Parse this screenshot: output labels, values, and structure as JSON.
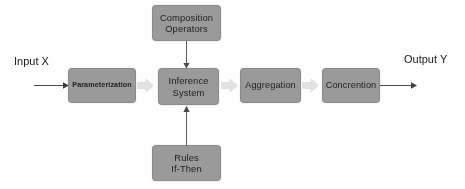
{
  "diagram": {
    "type": "flowchart",
    "canvas": {
      "width": 465,
      "height": 189,
      "background": "#fefefe"
    },
    "palette": {
      "box_fill": "#9a9a9a",
      "box_border": "#8a8a8a",
      "box_text": "#1d1d1d",
      "label_text": "#202020",
      "thin_arrow": "#4a4a4a",
      "block_arrow_fill": "#e2e2e2",
      "block_arrow_stroke": "#d2d2d2",
      "connector_line": "#5a5a5a"
    },
    "labels": {
      "input": "Input X",
      "output": "Output Y"
    },
    "nodes": [
      {
        "id": "parameterization",
        "label": "Parameterization",
        "lines": [
          "Parameterization"
        ],
        "stage": 1,
        "row": "main",
        "bold": true
      },
      {
        "id": "inference_system",
        "label": "Inference System",
        "lines": [
          "Inference",
          "System"
        ],
        "stage": 2,
        "row": "main",
        "bold": false
      },
      {
        "id": "composition_operators",
        "label": "Composition Operators",
        "lines": [
          "Composition",
          "Operators"
        ],
        "stage": 2,
        "row": "top",
        "bold": false
      },
      {
        "id": "rules_if_then",
        "label": "Rules If-Then",
        "lines": [
          "Rules",
          "If-Then"
        ],
        "stage": 2,
        "row": "bottom",
        "bold": false
      },
      {
        "id": "aggregation",
        "label": "Aggregation",
        "lines": [
          "Aggregation"
        ],
        "stage": 3,
        "row": "main",
        "bold": false
      },
      {
        "id": "concretion",
        "label": "Concrention",
        "lines": [
          "Concrention"
        ],
        "stage": 4,
        "row": "main",
        "bold": false
      }
    ],
    "edges": [
      {
        "id": "input-to-parameterization",
        "from": "Input X",
        "to": "parameterization",
        "style": "thin-line-arrow",
        "direction": "right"
      },
      {
        "id": "parameterization-to-inference",
        "from": "parameterization",
        "to": "inference_system",
        "style": "block-arrow",
        "direction": "right"
      },
      {
        "id": "inference-to-aggregation",
        "from": "inference_system",
        "to": "aggregation",
        "style": "block-arrow",
        "direction": "right"
      },
      {
        "id": "aggregation-to-concretion",
        "from": "aggregation",
        "to": "concretion",
        "style": "block-arrow",
        "direction": "right"
      },
      {
        "id": "concretion-to-output",
        "from": "concretion",
        "to": "Output Y",
        "style": "thin-line-arrow",
        "direction": "right"
      },
      {
        "id": "composition-to-inference",
        "from": "composition_operators",
        "to": "inference_system",
        "style": "thin-line-arrow",
        "direction": "down"
      },
      {
        "id": "rules-to-inference",
        "from": "rules_if_then",
        "to": "inference_system",
        "style": "thin-line-arrow",
        "direction": "up"
      }
    ]
  }
}
